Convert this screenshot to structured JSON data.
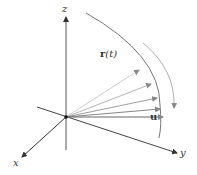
{
  "diagram": {
    "axes": {
      "x_label": "x",
      "y_label": "y",
      "z_label": "z"
    },
    "labels": {
      "curve_label_bold": "r",
      "curve_label_arg": "(t)",
      "unit_vector_label": "u"
    },
    "colors": {
      "axis": "#333333",
      "curve": "#777777",
      "vectors": [
        "#cccccc",
        "#b5b5b5",
        "#9e9e9e",
        "#878787",
        "#6e6e6e"
      ]
    }
  }
}
